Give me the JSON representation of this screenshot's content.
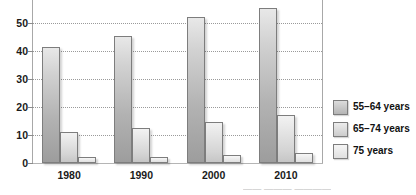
{
  "chart_data": {
    "type": "bar",
    "title": "",
    "subtitle": "",
    "xlabel": "",
    "ylabel": "",
    "categories": [
      "1980",
      "1990",
      "2000",
      "2010"
    ],
    "series": [
      {
        "name": "55–64 years",
        "values": [
          41.5,
          45.5,
          52,
          55.5
        ],
        "color": "#b4b4b4"
      },
      {
        "name": "65–74 years",
        "values": [
          11,
          12.5,
          14.5,
          17
        ],
        "color": "#cccccc"
      },
      {
        "name": "75 years",
        "values": [
          2,
          2,
          3,
          3.5
        ],
        "color": "#e0e0e0"
      }
    ],
    "ylim": [
      0,
      57
    ],
    "yticks": [
      0,
      10,
      20,
      30,
      40,
      50
    ],
    "ytick_labels": [
      "0",
      "10",
      "20",
      "30",
      "40",
      "50"
    ],
    "grid": true,
    "grid_style": "dotted",
    "legend_position": "right"
  },
  "legend": {
    "items": [
      {
        "label": "55–64 years"
      },
      {
        "label": "65–74 years"
      },
      {
        "label": "75 years"
      }
    ]
  },
  "caption": {
    "fragment": "—— ——— ————"
  }
}
